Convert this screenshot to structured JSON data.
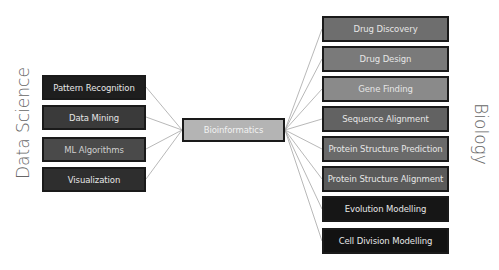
{
  "diagram": {
    "left_group": {
      "label": "Data Science",
      "nodes": [
        {
          "label": "Pattern Recognition",
          "color": "#1e1e1e"
        },
        {
          "label": "Data Mining",
          "color": "#3a3a3a"
        },
        {
          "label": "ML Algorithms",
          "color": "#4a4a4a"
        },
        {
          "label": "Visualization",
          "color": "#2e2e2e"
        }
      ]
    },
    "center": {
      "label": "Bioinformatics",
      "color": "#b4b4b4"
    },
    "right_group": {
      "label": "Biology",
      "nodes": [
        {
          "label": "Drug Discovery",
          "color": "#6e6e6e"
        },
        {
          "label": "Drug Design",
          "color": "#7a7a7a"
        },
        {
          "label": "Gene Finding",
          "color": "#8a8a8a"
        },
        {
          "label": "Sequence Alignment",
          "color": "#626262"
        },
        {
          "label": "Protein Structure Prediction",
          "color": "#6a6a6a"
        },
        {
          "label": "Protein Structure Alignment",
          "color": "#5a5a5a"
        },
        {
          "label": "Evolution Modelling",
          "color": "#161616"
        },
        {
          "label": "Cell Division Modelling",
          "color": "#121212"
        }
      ]
    },
    "edge_color": "#a0a0a0"
  }
}
